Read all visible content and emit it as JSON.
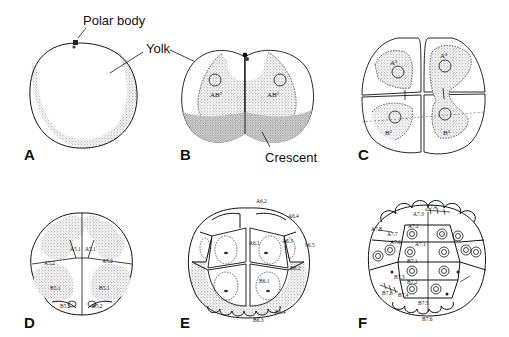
{
  "figure": {
    "panels": [
      {
        "letter": "A",
        "stage": "uncleaved egg",
        "callouts": [
          "Polar body",
          "Yolk"
        ]
      },
      {
        "letter": "B",
        "stage": "2-cell",
        "callouts": [
          "Crescent"
        ],
        "cell_labels": [
          "AB²",
          "AB²"
        ]
      },
      {
        "letter": "C",
        "stage": "4-cell",
        "cell_labels": [
          "A³",
          "A³",
          "B³",
          "B³"
        ]
      },
      {
        "letter": "D",
        "stage": "8-cell",
        "cell_labels": [
          "A5.1",
          "A5.1",
          "A5.2",
          "A5.2",
          "B5.1",
          "B5.1",
          "B5.2",
          "B5.2"
        ]
      },
      {
        "letter": "E",
        "stage": "16-cell",
        "cell_labels": [
          "A6.2",
          "A6.4",
          "A6.1",
          "A6.3",
          "b6.5",
          "B6.2",
          "B6.1",
          "B6.4",
          "B6.3"
        ]
      },
      {
        "letter": "F",
        "stage": "32-cell",
        "cell_labels": [
          "A7.4",
          "A7.3",
          "A7.2",
          "A7.1",
          "A7.8",
          "A7.7",
          "A7.6",
          "B7.1",
          "B7.2",
          "B7.3",
          "B7.4",
          "B7.5",
          "B7.6",
          "B7.8"
        ]
      }
    ]
  },
  "labels": {
    "polar_body": "Polar body",
    "yolk": "Yolk",
    "crescent": "Crescent",
    "A": "A",
    "B": "B",
    "C": "C",
    "D": "D",
    "E": "E",
    "F": "F",
    "b_ab2_left": "AB²",
    "b_ab2_right": "AB²",
    "c_a3_left": "A³",
    "c_a3_right": "A³",
    "c_b3_left": "B³",
    "c_b3_right": "B³",
    "d_a51_left": "A5.1",
    "d_a51_right": "A5.1",
    "d_a52_left": "A5.2",
    "d_a52_right": "A5.2",
    "d_b51_left": "B5.1",
    "d_b51_right": "B5.1",
    "d_b52_left": "B5.2",
    "d_b52_right": "B5.2",
    "e_a62": "A6.2",
    "e_a64": "A6.4",
    "e_a61": "A6.1",
    "e_a63": "A6.3",
    "e_b65": "b6.5",
    "e_b62": "B6.2",
    "e_b61": "B6.1",
    "e_b64": "B6.4",
    "e_b63": "B6.3",
    "f_a74": "A7.4",
    "f_a73": "A7.3",
    "f_a72": "A7.2",
    "f_a71": "A7.1",
    "f_a78": "A7.8",
    "f_a77": "A7.7",
    "f_a76": "A7.6",
    "f_b71": "B7.1",
    "f_b72": "B7.2",
    "f_b73": "B7.3",
    "f_b74": "B7.4",
    "f_b75": "B7.5",
    "f_b76": "B7.6",
    "f_b78": "B7.8"
  }
}
